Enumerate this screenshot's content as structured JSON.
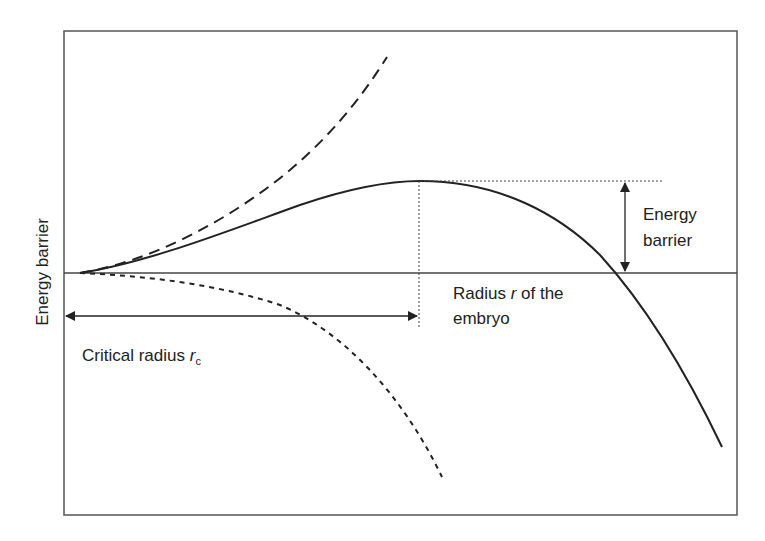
{
  "diagram": {
    "y_axis_label": "Energy barrier",
    "barrier_label_line1": "Energy",
    "barrier_label_line2": "barrier",
    "radius_label_prefix": "Radius ",
    "radius_label_var": "r",
    "radius_label_suffix": " of the",
    "radius_label_line2": "embryo",
    "critical_label_prefix": "Critical radius ",
    "critical_label_var": "r",
    "critical_label_sub": "c",
    "colors": {
      "frame": "#555555",
      "curve": "#222222",
      "guide": "#444444",
      "background": "#ffffff"
    },
    "curves": [
      {
        "name": "surface-energy-term",
        "style": "long-dash",
        "description": "increasing positive term (~r^2)"
      },
      {
        "name": "total-free-energy",
        "style": "solid",
        "description": "net energy with maximum at critical radius"
      },
      {
        "name": "volume-energy-term",
        "style": "short-dash",
        "description": "decreasing negative term (~-r^3)"
      }
    ]
  }
}
